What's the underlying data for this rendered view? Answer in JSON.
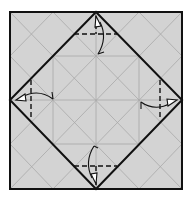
{
  "diagram": {
    "type": "origami-fold-diagram",
    "colors": {
      "paper": "#d3d3d3",
      "crease": "#a8a8a8",
      "edge": "#111111",
      "background": "#ffffff"
    },
    "sheet": {
      "x": 10,
      "y": 12,
      "width": 172,
      "height": 177
    },
    "diamond": {
      "top": [
        96,
        12
      ],
      "right": [
        182,
        100
      ],
      "bottom": [
        96,
        189
      ],
      "left": [
        10,
        100
      ]
    },
    "folds": [
      {
        "name": "top",
        "dash": [
          [
            74,
            34
          ],
          [
            117,
            34
          ]
        ],
        "direction": "down"
      },
      {
        "name": "bottom",
        "dash": [
          [
            74,
            166
          ],
          [
            117,
            166
          ]
        ],
        "direction": "up"
      },
      {
        "name": "left",
        "dash": [
          [
            31,
            80
          ],
          [
            31,
            119
          ]
        ],
        "direction": "right"
      },
      {
        "name": "right",
        "dash": [
          [
            160,
            80
          ],
          [
            160,
            119
          ]
        ],
        "direction": "left"
      }
    ]
  }
}
